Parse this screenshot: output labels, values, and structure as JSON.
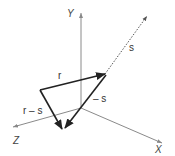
{
  "diagram": {
    "axes": {
      "x_label": "X",
      "y_label": "Y",
      "z_label": "Z"
    },
    "vectors": {
      "s_label": "s",
      "r_label": "r",
      "neg_s_label": "– s",
      "r_minus_s_label": "r – s"
    },
    "colors": {
      "axis": "#8a8a8a",
      "vector": "#2a2a2a",
      "dotted": "#555555",
      "text": "#333333"
    }
  }
}
